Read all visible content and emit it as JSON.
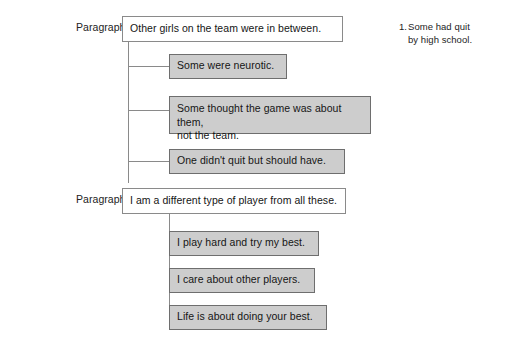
{
  "diagram": {
    "groups": [
      {
        "label": "Paragraph 6",
        "main": {
          "text": "Other girls on the team were in between."
        },
        "children": [
          {
            "text": "Some were neurotic."
          },
          {
            "line1": "Some thought the game was about them,",
            "line2": "not the team."
          },
          {
            "text": "One didn't quit but should have."
          }
        ]
      },
      {
        "label": "Paragraph 7",
        "main": {
          "text": "I am a different type of player from all these."
        },
        "children": [
          {
            "text": "I play hard and try my best."
          },
          {
            "text": "I care about other players."
          },
          {
            "text": "Life is about doing your best."
          }
        ]
      }
    ],
    "annotation": {
      "number": "1.",
      "line1": "Some had quit",
      "line2": "by high school."
    },
    "colors": {
      "main_box_fill": "#ffffff",
      "sub_box_fill": "#cdcdcd",
      "border": "#8a8a8a",
      "text": "#151515",
      "background": "#ffffff"
    }
  }
}
